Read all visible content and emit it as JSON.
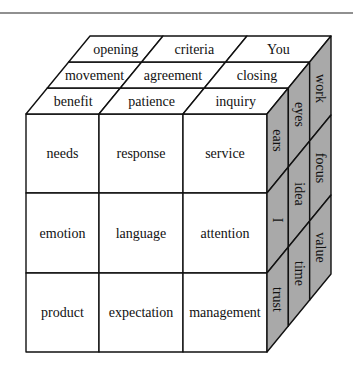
{
  "diagram": {
    "type": "3x3x3 word cube",
    "colors": {
      "side_face": "#a9a9a9",
      "front_face": "#ffffff",
      "top_face": "#ffffff",
      "line": "#111111"
    },
    "top_face": {
      "rows_back_to_front": [
        [
          "opening",
          "criteria",
          "You"
        ],
        [
          "movement",
          "agreement",
          "closing"
        ],
        [
          "benefit",
          "patience",
          "inquiry"
        ]
      ]
    },
    "front_face": {
      "rows_top_to_bottom": [
        [
          "needs",
          "response",
          "service"
        ],
        [
          "emotion",
          "language",
          "attention"
        ],
        [
          "product",
          "expectation",
          "management"
        ]
      ]
    },
    "side_face": {
      "columns_front_to_back": [
        [
          "ears",
          "I",
          "trust"
        ],
        [
          "eyes",
          "idea",
          "time"
        ],
        [
          "work",
          "focus",
          "value"
        ]
      ]
    }
  }
}
